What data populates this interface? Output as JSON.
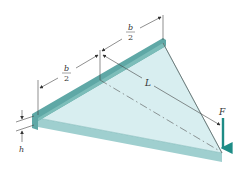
{
  "diagram": {
    "labels": {
      "half_width_left_num": "b",
      "half_width_left_den": "2",
      "half_width_right_num": "b",
      "half_width_right_den": "2",
      "length": "L",
      "force": "F",
      "thickness": "h"
    },
    "colors": {
      "plate_top": "#d8eef0",
      "plate_edge": "#9fcfcf",
      "support_bar": "#5fa8a6",
      "force_arrow": "#1e8c86",
      "dimension_lines": "#444444"
    }
  }
}
